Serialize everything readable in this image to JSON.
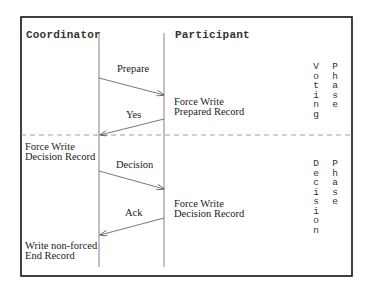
{
  "diagram": {
    "lifelines": [
      {
        "name": "Coordinator",
        "x": 99
      },
      {
        "name": "Participant",
        "x": 164
      }
    ],
    "messages": [
      {
        "label": "Prepare",
        "from": "Coordinator",
        "to": "Participant"
      },
      {
        "label": "Yes",
        "from": "Participant",
        "to": "Coordinator"
      },
      {
        "label": "Decision",
        "from": "Coordinator",
        "to": "Participant"
      },
      {
        "label": "Ack",
        "from": "Participant",
        "to": "Coordinator"
      }
    ],
    "actions": {
      "participant_prepare_1": "Force Write",
      "participant_prepare_2": "Prepared Record",
      "coordinator_decision_1": "Force Write",
      "coordinator_decision_2": "Decision Record",
      "participant_decision_1": "Force Write",
      "participant_decision_2": "Decision Record",
      "coordinator_end_1": "Write non-forced",
      "coordinator_end_2": "End Record"
    },
    "phases": {
      "voting_word1": "Voting",
      "voting_word2": "Phase",
      "decision_word1": "Decision",
      "decision_word2": "Phase"
    },
    "colors": {
      "border": "#111111",
      "lines": "#555555",
      "dashed": "#777777",
      "text": "#222222"
    }
  }
}
